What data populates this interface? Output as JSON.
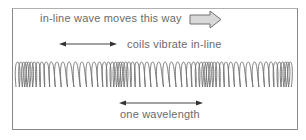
{
  "diagram": {
    "title_label": "in-line wave moves this way",
    "vibration_label": "coils vibrate in-line",
    "wavelength_label": "one wavelength",
    "icons": {
      "direction_arrow": "block-right-arrow-icon",
      "vibration_arrow": "double-headed-arrow-icon",
      "wavelength_arrow": "double-headed-arrow-icon",
      "spring": "coiled-spring-icon"
    },
    "colors": {
      "text": "#6a6a6a",
      "frame": "#8a8a8a",
      "coil": "#6e6e6e",
      "arrow_fill": "#d8d8d8",
      "arrow_stroke": "#707070",
      "background": "#ffffff"
    },
    "spring": {
      "x_start": 16,
      "x_end": 290,
      "y_top": 62,
      "y_bottom": 87,
      "compression_centers_x": [
        24,
        117,
        205,
        285
      ],
      "wavelength_px": 88
    }
  }
}
